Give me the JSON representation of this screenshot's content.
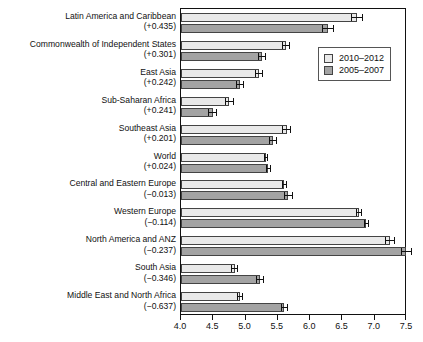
{
  "chart_data": {
    "type": "bar",
    "orientation": "horizontal",
    "title": "",
    "xlabel": "",
    "ylabel": "",
    "xlim": [
      4.0,
      7.5
    ],
    "xticks": [
      "4.0",
      "4.5",
      "5.0",
      "5.5",
      "6.0",
      "6.5",
      "7.0",
      "7.5"
    ],
    "grid": false,
    "legend_position": "top-right",
    "legend": [
      "2010–2012",
      "2005–2007"
    ],
    "categories": [
      "Latin America and Caribbean",
      "Commonwealth of Independent States",
      "East Asia",
      "Sub-Saharan Africa",
      "Southeast Asia",
      "World",
      "Central and Eastern Europe",
      "Western Europe",
      "North America and ANZ",
      "South Asia",
      "Middle East and North Africa"
    ],
    "category_deltas": [
      "(+0.435)",
      "(+0.301)",
      "(+0.242)",
      "(+0.241)",
      "(+0.201)",
      "(+0.024)",
      "(−0.013)",
      "(−0.114)",
      "(−0.237)",
      "(−0.346)",
      "(−0.637)"
    ],
    "series": [
      {
        "name": "2010–2012",
        "color": "#e9e9e9",
        "values": [
          6.73,
          5.63,
          5.21,
          4.75,
          5.64,
          5.31,
          5.6,
          6.76,
          7.24,
          4.83,
          4.91
        ],
        "errors": [
          0.09,
          0.06,
          0.06,
          0.07,
          0.07,
          0.03,
          0.04,
          0.05,
          0.08,
          0.06,
          0.05
        ]
      },
      {
        "name": "2005–2007",
        "color": "#a3a3a3",
        "values": [
          6.28,
          5.25,
          4.91,
          4.49,
          5.43,
          5.35,
          5.66,
          6.87,
          7.49,
          5.22,
          5.6
        ],
        "errors": [
          0.09,
          0.06,
          0.06,
          0.07,
          0.06,
          0.04,
          0.07,
          0.04,
          0.09,
          0.06,
          0.05
        ]
      }
    ]
  }
}
